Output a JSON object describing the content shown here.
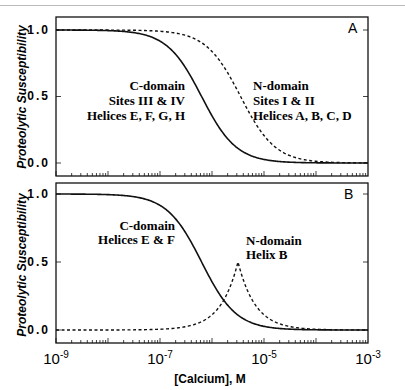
{
  "chart_data": [
    {
      "panel": "A",
      "type": "line",
      "xscale": "log",
      "xlim": [
        1e-09,
        0.001
      ],
      "ylim": [
        -0.1,
        1.1
      ],
      "ylabel": "Proteolytic  Susceptibility",
      "yticks": [
        "1.0",
        "0.5",
        "0.0"
      ],
      "series": [
        {
          "name": "C-domain Sites III & IV Helices E, F, G, H",
          "style": "solid",
          "midpoint_log10": -6.2,
          "hill": 1.3
        },
        {
          "name": "N-domain Sites I & II Helices A, B, C, D",
          "style": "dashed",
          "midpoint_log10": -5.45,
          "hill": 1.3
        }
      ],
      "annotations": [
        [
          "C-domain",
          "Sites III & IV",
          "Helices E, F, G, H"
        ],
        [
          "N-domain",
          "Sites I & II",
          "Helices A, B, C, D"
        ]
      ]
    },
    {
      "panel": "B",
      "type": "line",
      "xscale": "log",
      "xlim": [
        1e-09,
        0.001
      ],
      "ylim": [
        -0.1,
        1.1
      ],
      "ylabel": "Proteolytic  Susceptibility",
      "yticks": [
        "1.0",
        "0.5",
        "0.0"
      ],
      "xlabel": "[Calcium], M",
      "xticks": [
        "10-9",
        "10-7",
        "10-5",
        "10-3"
      ],
      "series": [
        {
          "name": "C-domain Helices E & F",
          "style": "solid",
          "midpoint_log10": -6.2,
          "hill": 1.3
        },
        {
          "name": "N-domain Helix B",
          "style": "dashed",
          "peak_log10": -5.5,
          "peak_value": 0.5
        }
      ],
      "annotations": [
        [
          "C-domain",
          "Helices E & F"
        ],
        [
          "N-domain",
          "Helix B"
        ]
      ]
    }
  ],
  "panels": {
    "a": {
      "label": "A",
      "c_lines": [
        "C-domain",
        "Sites III & IV",
        "Helices E, F, G, H"
      ],
      "n_lines": [
        "N-domain",
        "Sites I & II",
        "Helices A, B, C, D"
      ]
    },
    "b": {
      "label": "B",
      "c_lines": [
        "C-domain",
        "Helices E & F"
      ],
      "n_lines": [
        "N-domain",
        "Helix B"
      ]
    }
  },
  "axis": {
    "ylabel": "Proteolytic  Susceptibility",
    "yticks": [
      "1.0",
      "0.5",
      "0.0"
    ],
    "xlabel": "[Calcium], M",
    "xticks": [
      {
        "base": "10",
        "exp": "-9"
      },
      {
        "base": "10",
        "exp": "-7"
      },
      {
        "base": "10",
        "exp": "-5"
      },
      {
        "base": "10",
        "exp": "-3"
      }
    ]
  }
}
